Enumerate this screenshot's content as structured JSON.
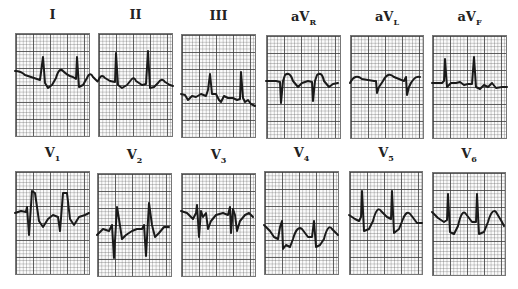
{
  "figure": {
    "rows": [
      {
        "name": "limb-leads",
        "leads": [
          {
            "label": "I",
            "sub": ""
          },
          {
            "label": "II",
            "sub": ""
          },
          {
            "label": "III",
            "sub": ""
          },
          {
            "label": "aV",
            "sub": "R"
          },
          {
            "label": "aV",
            "sub": "L"
          },
          {
            "label": "aV",
            "sub": "F"
          }
        ]
      },
      {
        "name": "precordial-leads",
        "leads": [
          {
            "label": "V",
            "sub": "1"
          },
          {
            "label": "V",
            "sub": "2"
          },
          {
            "label": "V",
            "sub": "3"
          },
          {
            "label": "V",
            "sub": "4"
          },
          {
            "label": "V",
            "sub": "5"
          },
          {
            "label": "V",
            "sub": "6"
          }
        ]
      }
    ]
  },
  "colors": {
    "trace": "#1a1a1a",
    "grid_major": "#3c3c3c",
    "grid_minor": "#8a8a8a",
    "paper": "#fbfbfb"
  }
}
